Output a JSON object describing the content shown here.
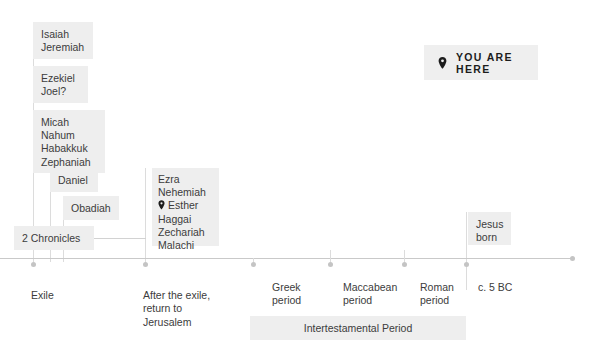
{
  "page": {
    "background_color": "#ffffff",
    "chip_color": "#eeeeee",
    "line_color": "#d2d2d2",
    "text_color": "#3c3c3c"
  },
  "badge": {
    "label": "YOU ARE HERE",
    "icon": "map-pin-icon"
  },
  "prophet_groups": [
    {
      "id": "isaiah-jeremiah",
      "text": "Isaiah\nJeremiah"
    },
    {
      "id": "ezekiel-joel",
      "text": "Ezekiel\nJoel?"
    },
    {
      "id": "micah-nahum-habakkuk-zephaniah",
      "text": "Micah\nNahum\nHabakkuk\nZephaniah"
    },
    {
      "id": "daniel",
      "text": "Daniel"
    },
    {
      "id": "obadiah",
      "text": "Obadiah"
    },
    {
      "id": "two-chronicles",
      "text": "2 Chronicles"
    }
  ],
  "post_exile_box": {
    "id": "post-exile-books",
    "lines_before_pin": [
      "Ezra",
      "Nehemiah"
    ],
    "pin_line": "Esther",
    "pin_icon": "map-pin-icon",
    "lines_after_pin": [
      "Haggai",
      "Zechariah",
      "Malachi"
    ]
  },
  "jesus_box": {
    "id": "jesus-born",
    "text": "Jesus\nborn"
  },
  "axis_labels": [
    {
      "id": "exile",
      "text": "Exile"
    },
    {
      "id": "after-the-exile",
      "text": "After the exile,\nreturn to\nJerusalem"
    },
    {
      "id": "greek-period",
      "text": "Greek\nperiod"
    },
    {
      "id": "maccabean-period",
      "text": "Maccabean\nperiod"
    },
    {
      "id": "roman-period",
      "text": "Roman\nperiod"
    },
    {
      "id": "c-5-bc",
      "text": "c. 5 BC"
    }
  ],
  "period_band": {
    "id": "intertestamental-period",
    "label": "Intertestamental Period"
  }
}
